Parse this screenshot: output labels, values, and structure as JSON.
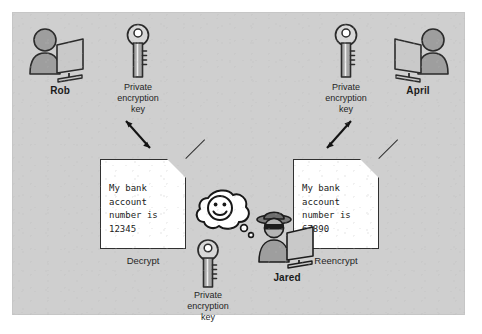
{
  "diagram": {
    "background_color": "#cfcfcf",
    "panel_border_color": "#c6c6c6"
  },
  "actors": {
    "left": {
      "name": "Rob",
      "icon": "person-at-computer-icon"
    },
    "right": {
      "name": "April",
      "icon": "person-at-computer-icon"
    },
    "middle": {
      "name": "Jared",
      "icon": "hacker-at-computer-icon"
    }
  },
  "keys": {
    "left": {
      "label": "Private\nencryption\nkey",
      "line1": "Private",
      "line2": "encryption",
      "line3": "key"
    },
    "right": {
      "label": "Private\nencryption\nkey",
      "line1": "Private",
      "line2": "encryption",
      "line3": "key"
    },
    "middle": {
      "label": "Private\nencryption\nkey",
      "line1": "Private",
      "line2": "encryption",
      "line3": "key"
    }
  },
  "documents": {
    "left": {
      "text": "My bank\naccount\nnumber is\n12345",
      "caption": "Decrypt"
    },
    "right": {
      "text": "My bank\naccount\nnumber is\n67890",
      "caption": "Reencrypt"
    }
  },
  "thought_bubble": {
    "icon": "smiley-face-icon",
    "owner": "Jared"
  },
  "connectors": {
    "left_arrow": {
      "type": "double-headed-arrow",
      "direction": "diagonal-down-right"
    },
    "right_arrow": {
      "type": "double-headed-arrow",
      "direction": "diagonal-up-right"
    }
  }
}
